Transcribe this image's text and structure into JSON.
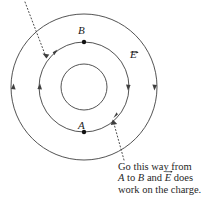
{
  "figure": {
    "background_color": "#ffffff",
    "line_color": "#3a3a3a",
    "text_color": "#1a1a1a",
    "center": {
      "x": 84,
      "y": 87
    },
    "circles": [
      {
        "name": "outer-circle",
        "radius": 73
      },
      {
        "name": "middle-circle",
        "radius": 45
      },
      {
        "name": "inner-circle",
        "radius": 23
      }
    ],
    "points": [
      {
        "name": "point-B",
        "label": "B",
        "x": 84,
        "y": 42
      },
      {
        "name": "point-A",
        "label": "A",
        "x": 84,
        "y": 132
      }
    ],
    "field_label": {
      "name": "field-label-E",
      "symbol": "E",
      "has_vector_arrow": true
    }
  },
  "caption": {
    "line1": "Go this way from",
    "line2_part1": "A",
    "line2_part2": " to ",
    "line2_part3": "B",
    "line2_part4": " and ",
    "line2_part5": "E",
    "line2_part6": " does",
    "line3": "work on the charge."
  }
}
